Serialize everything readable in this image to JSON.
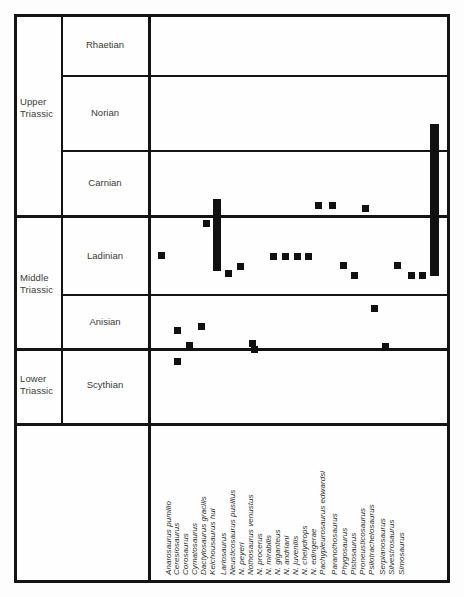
{
  "figure": {
    "type": "range-chart"
  },
  "epochs": [
    {
      "label": "Upper\nTriassic"
    },
    {
      "label": "Middle\nTriassic"
    },
    {
      "label": "Lower\nTriassic"
    }
  ],
  "stages": [
    {
      "label": "Rhaetian"
    },
    {
      "label": "Norian"
    },
    {
      "label": "Carnian"
    },
    {
      "label": "Ladinian"
    },
    {
      "label": "Anisian"
    },
    {
      "label": "Scythian"
    }
  ],
  "chart_data": {
    "type": "range-chart",
    "title": "",
    "xlabel": "",
    "ylabel": "",
    "grid": true,
    "legend": "none",
    "marker_color": "#111111",
    "y_categories": [
      "Rhaetian",
      "Norian",
      "Carnian",
      "Ladinian",
      "Anisian",
      "Scythian"
    ],
    "y_epochs": [
      "Upper Triassic",
      "Upper Triassic",
      "Upper Triassic",
      "Middle Triassic",
      "Middle Triassic",
      "Lower Triassic"
    ],
    "categories": [
      "Anarosaurus pumilio",
      "Ceresiosaurus",
      "Corosaurus",
      "Cymatosaurus",
      "Dactylosaurus gracilis",
      "Keichousaurus hui",
      "Lariosaurus",
      "Neusticosaurus pusillus",
      "N. peyeri",
      "Nothosaurus venustus",
      "N. procerus",
      "N. mirabilis",
      "N. giganteus",
      "N. andriani",
      "N. juvenilis",
      "N. chelydrops",
      "N. edingerae",
      "Pachypleurosaurus edwardsi",
      "Paranothosaurus",
      "Phygosaurus",
      "Pistosaurus",
      "Proneusticosaurus",
      "Psilotrachelosaurus",
      "Serpianosaurus",
      "Silvestrosaurus",
      "Simosaurus"
    ],
    "occurrences": [
      {
        "taxon": "Anarosaurus pumilio",
        "stage": "Anisian",
        "kind": "point"
      },
      {
        "taxon": "Ceresiosaurus",
        "stage": "Scythian",
        "kind": "point"
      },
      {
        "taxon": "Corosaurus",
        "stage": "Anisian",
        "kind": "point"
      },
      {
        "taxon": "Cymatosaurus",
        "stage": "Ladinian",
        "kind": "point"
      },
      {
        "taxon": "Dactylosaurus gracilis",
        "stage": "Ladinian",
        "kind": "point"
      },
      {
        "taxon": "Keichousaurus hui",
        "stage": "Ladinian",
        "kind": "point"
      },
      {
        "taxon": "Lariosaurus",
        "stage": "Carnian-Ladinian",
        "kind": "range"
      },
      {
        "taxon": "Neusticosaurus pusillus",
        "stage": "Ladinian",
        "kind": "point"
      },
      {
        "taxon": "N. peyeri",
        "stage": "Ladinian",
        "kind": "point"
      },
      {
        "taxon": "Nothosaurus venustus",
        "stage": "Anisian",
        "kind": "point"
      },
      {
        "taxon": "N. procerus",
        "stage": "Anisian",
        "kind": "point"
      },
      {
        "taxon": "N. mirabilis",
        "stage": "Ladinian",
        "kind": "point"
      },
      {
        "taxon": "N. giganteus",
        "stage": "Ladinian",
        "kind": "point"
      },
      {
        "taxon": "N. andriani",
        "stage": "Ladinian",
        "kind": "point"
      },
      {
        "taxon": "N. juvenilis",
        "stage": "Ladinian",
        "kind": "point"
      },
      {
        "taxon": "N. chelydrops",
        "stage": "Carnian",
        "kind": "point"
      },
      {
        "taxon": "N. edingerae",
        "stage": "Carnian",
        "kind": "point"
      },
      {
        "taxon": "Pachypleurosaurus edwardsi",
        "stage": "Ladinian",
        "kind": "point"
      },
      {
        "taxon": "Paranothosaurus",
        "stage": "Ladinian",
        "kind": "point"
      },
      {
        "taxon": "Phygosaurus",
        "stage": "Anisian",
        "kind": "point"
      },
      {
        "taxon": "Pistosaurus",
        "stage": "Carnian",
        "kind": "point"
      },
      {
        "taxon": "Proneusticosaurus",
        "stage": "Anisian",
        "kind": "point"
      },
      {
        "taxon": "Psilotrachelosaurus",
        "stage": "Ladinian",
        "kind": "point"
      },
      {
        "taxon": "Serpianosaurus",
        "stage": "Ladinian",
        "kind": "point"
      },
      {
        "taxon": "Silvestrosaurus",
        "stage": "Ladinian",
        "kind": "point"
      },
      {
        "taxon": "Simosaurus",
        "stage": "Norian-Ladinian",
        "kind": "range"
      }
    ]
  },
  "markers": [
    {
      "name": "marker-anarosaurus-pumilio",
      "x": 174,
      "y": 327,
      "w": 7,
      "h": 7,
      "kind": "point"
    },
    {
      "name": "marker-ceresiosaurus",
      "x": 174,
      "y": 358,
      "w": 7,
      "h": 7,
      "kind": "point"
    },
    {
      "name": "marker-corosaurus",
      "x": 186,
      "y": 342,
      "w": 7,
      "h": 7,
      "kind": "point"
    },
    {
      "name": "marker-cymatosaurus",
      "x": 198,
      "y": 323,
      "w": 7,
      "h": 7,
      "kind": "point"
    },
    {
      "name": "marker-dactylosaurus-gracilis",
      "x": 158,
      "y": 252,
      "w": 7,
      "h": 7,
      "kind": "point"
    },
    {
      "name": "marker-keichousaurus-hui",
      "x": 203,
      "y": 220,
      "w": 7,
      "h": 7,
      "kind": "point"
    },
    {
      "name": "range-lariosaurus",
      "x": 213,
      "y": 199,
      "w": 8,
      "h": 72,
      "kind": "range"
    },
    {
      "name": "marker-neusticosaurus-pusillus",
      "x": 225,
      "y": 270,
      "w": 7,
      "h": 7,
      "kind": "point"
    },
    {
      "name": "marker-n-peyeri",
      "x": 237,
      "y": 263,
      "w": 7,
      "h": 7,
      "kind": "point"
    },
    {
      "name": "marker-nothosaurus-venustus",
      "x": 249,
      "y": 340,
      "w": 7,
      "h": 7,
      "kind": "point"
    },
    {
      "name": "marker-n-procerus",
      "x": 251,
      "y": 346,
      "w": 7,
      "h": 7,
      "kind": "point"
    },
    {
      "name": "marker-n-mirabilis",
      "x": 270,
      "y": 253,
      "w": 7,
      "h": 7,
      "kind": "point"
    },
    {
      "name": "marker-n-giganteus",
      "x": 282,
      "y": 253,
      "w": 7,
      "h": 7,
      "kind": "point"
    },
    {
      "name": "marker-n-andriani",
      "x": 294,
      "y": 253,
      "w": 7,
      "h": 7,
      "kind": "point"
    },
    {
      "name": "marker-n-juvenilis",
      "x": 305,
      "y": 253,
      "w": 7,
      "h": 7,
      "kind": "point"
    },
    {
      "name": "marker-n-chelydrops",
      "x": 315,
      "y": 202,
      "w": 7,
      "h": 7,
      "kind": "point"
    },
    {
      "name": "marker-n-edingerae",
      "x": 329,
      "y": 202,
      "w": 7,
      "h": 7,
      "kind": "point"
    },
    {
      "name": "marker-pachypleurosaurus-edwardsi",
      "x": 340,
      "y": 262,
      "w": 7,
      "h": 7,
      "kind": "point"
    },
    {
      "name": "marker-paranothosaurus",
      "x": 351,
      "y": 272,
      "w": 7,
      "h": 7,
      "kind": "point"
    },
    {
      "name": "marker-phygosaurus",
      "x": 371,
      "y": 305,
      "w": 7,
      "h": 7,
      "kind": "point"
    },
    {
      "name": "marker-pistosaurus",
      "x": 362,
      "y": 205,
      "w": 7,
      "h": 7,
      "kind": "point"
    },
    {
      "name": "marker-proneusticosaurus",
      "x": 382,
      "y": 343,
      "w": 7,
      "h": 7,
      "kind": "point"
    },
    {
      "name": "marker-psilotrachelosaurus",
      "x": 394,
      "y": 262,
      "w": 7,
      "h": 7,
      "kind": "point"
    },
    {
      "name": "marker-serpianosaurus",
      "x": 408,
      "y": 272,
      "w": 7,
      "h": 7,
      "kind": "point"
    },
    {
      "name": "marker-silvestrosaurus",
      "x": 419,
      "y": 272,
      "w": 7,
      "h": 7,
      "kind": "point"
    },
    {
      "name": "range-simosaurus",
      "x": 430,
      "y": 124,
      "w": 9,
      "h": 152,
      "kind": "range"
    }
  ],
  "taxon_positions": [
    {
      "label": "Anarosaurus pumilio",
      "x": 173
    },
    {
      "label": "Ceresiosaurus",
      "x": 181
    },
    {
      "label": "Corosaurus",
      "x": 190
    },
    {
      "label": "Cymatosaurus",
      "x": 199
    },
    {
      "label": "Dactylosaurus gracilis",
      "x": 208
    },
    {
      "label": "Keichousaurus hui",
      "x": 217
    },
    {
      "label": "Lariosaurus",
      "x": 228
    },
    {
      "label": "Neusticosaurus pusillus",
      "x": 237
    },
    {
      "label": "N. peyeri",
      "x": 246
    },
    {
      "label": "Nothosaurus venustus",
      "x": 255
    },
    {
      "label": "N. procerus",
      "x": 264
    },
    {
      "label": "N. mirabilis",
      "x": 273
    },
    {
      "label": "N. giganteus",
      "x": 282
    },
    {
      "label": "N. andriani",
      "x": 291
    },
    {
      "label": "N. juvenilis",
      "x": 300
    },
    {
      "label": "N. chelydrops",
      "x": 309
    },
    {
      "label": "N. edingerae",
      "x": 318
    },
    {
      "label": "Pachypleurosaurus edwardsi",
      "x": 327
    },
    {
      "label": "Paranothosaurus",
      "x": 339
    },
    {
      "label": "Phygosaurus",
      "x": 349
    },
    {
      "label": "Pistosaurus",
      "x": 358
    },
    {
      "label": "Proneusticosaurus",
      "x": 367
    },
    {
      "label": "Psilotrachelosaurus",
      "x": 376
    },
    {
      "label": "Serpianosaurus",
      "x": 387
    },
    {
      "label": "Silvestrosaurus",
      "x": 396
    },
    {
      "label": "Simosaurus",
      "x": 406
    }
  ]
}
